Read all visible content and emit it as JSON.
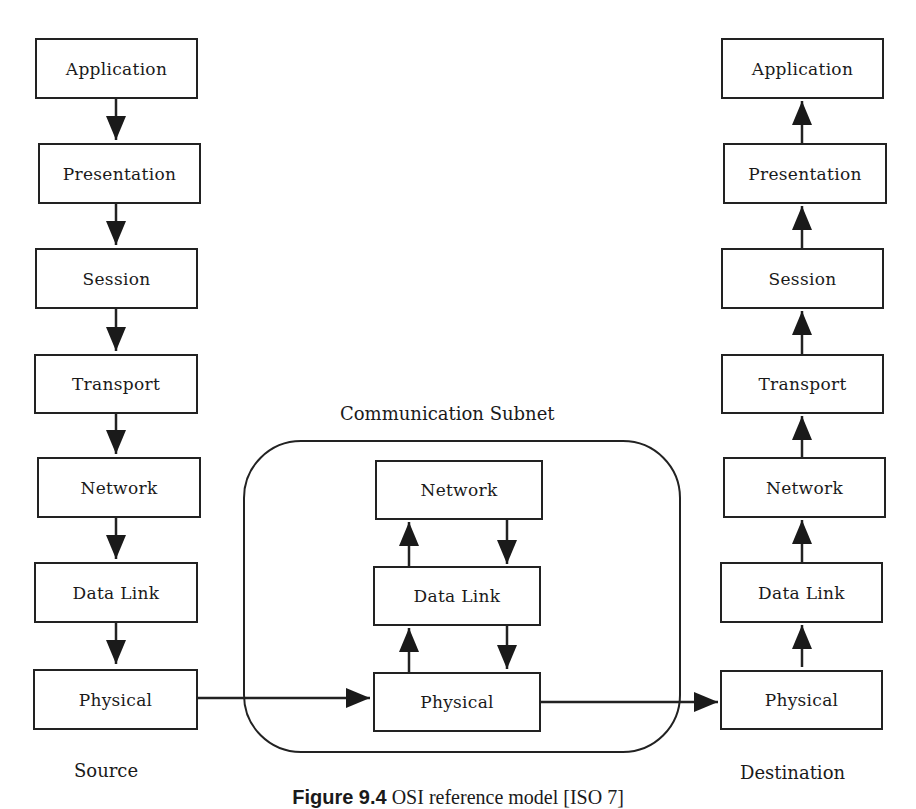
{
  "diagram": {
    "source_stack": {
      "label": "Source",
      "layers": [
        "Application",
        "Presentation",
        "Session",
        "Transport",
        "Network",
        "Data Link",
        "Physical"
      ],
      "arrow_direction": "down"
    },
    "subnet": {
      "label": "Communication Subnet",
      "layers": [
        "Network",
        "Data Link",
        "Physical"
      ],
      "arrows": "up on left, down on right between layers"
    },
    "destination_stack": {
      "label": "Destination",
      "layers": [
        "Application",
        "Presentation",
        "Session",
        "Transport",
        "Network",
        "Data Link",
        "Physical"
      ],
      "arrow_direction": "up"
    },
    "connections": [
      "Source Physical -> Subnet Physical",
      "Subnet Physical -> Destination Physical"
    ],
    "caption": {
      "prefix": "Figure 9.4",
      "text": "OSI reference model [ISO 7]"
    }
  }
}
